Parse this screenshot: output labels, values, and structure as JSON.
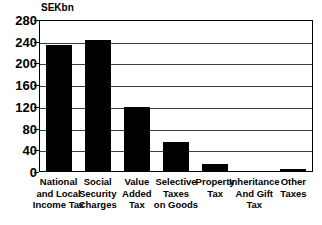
{
  "chart_data": {
    "type": "bar",
    "title": "",
    "subtitle": "",
    "xlabel": "",
    "ylabel": "SEKbn",
    "ylim": [
      0,
      280
    ],
    "yticks": [
      0,
      40,
      80,
      120,
      160,
      200,
      240,
      280
    ],
    "ytick_labels": [
      "0",
      "40",
      "80",
      "120",
      "160",
      "200",
      "240",
      "280"
    ],
    "grid": true,
    "legend": null,
    "bar_color": "#000000",
    "categories": [
      "National and Local Income Tax",
      "Social Security Charges",
      "Value Added Tax",
      "Selective Taxes on Goods",
      "Property Tax",
      "Inheritance And Gift Tax",
      "Other Taxes"
    ],
    "category_lines": [
      [
        "National",
        "and Local",
        "Income Tax"
      ],
      [
        "Social",
        "Security",
        "Charges"
      ],
      [
        "Value",
        "Added",
        "Tax"
      ],
      [
        "Selective",
        "Taxes",
        "on Goods"
      ],
      [
        "Property",
        "Tax"
      ],
      [
        "Inheritance",
        "And Gift",
        "Tax"
      ],
      [
        "Other",
        "Taxes"
      ]
    ],
    "values": [
      234,
      243,
      119,
      56,
      14,
      0,
      5
    ],
    "series": [
      {
        "name": "Tax revenue",
        "values": [
          234,
          243,
          119,
          56,
          14,
          0,
          5
        ]
      }
    ]
  },
  "axis": {
    "unit_caption": "SEKbn"
  }
}
